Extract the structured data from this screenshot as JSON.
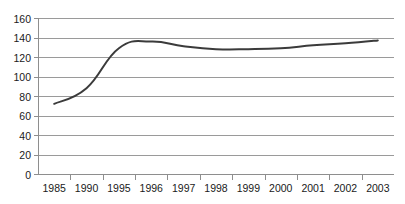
{
  "chart_data": {
    "type": "line",
    "title": "",
    "subtitle": "",
    "xlabel": "",
    "ylabel": "",
    "categories": [
      "1985",
      "1990",
      "1995",
      "1996",
      "1997",
      "1998",
      "1999",
      "2000",
      "2001",
      "2002",
      "2003"
    ],
    "series": [
      {
        "name": "",
        "values": [
          72,
          88,
          129,
          136,
          131,
          128,
          128,
          129,
          132,
          134,
          137
        ]
      }
    ],
    "ylim": [
      0,
      160
    ],
    "ytick_values": [
      0,
      20,
      40,
      60,
      80,
      100,
      120,
      140,
      160
    ],
    "ytick_labels": [
      "0",
      "20",
      "40",
      "60",
      "80",
      "100",
      "120",
      "140",
      "160"
    ],
    "grid": "horizontal",
    "legend": "none",
    "line_color": "#3b3b3b",
    "grid_color": "#9a9a9a",
    "axis_color": "#8e8e8e",
    "text_color": "#1a1a1a",
    "background": "#ffffff"
  },
  "figure": {
    "clipped_top_text": ""
  }
}
